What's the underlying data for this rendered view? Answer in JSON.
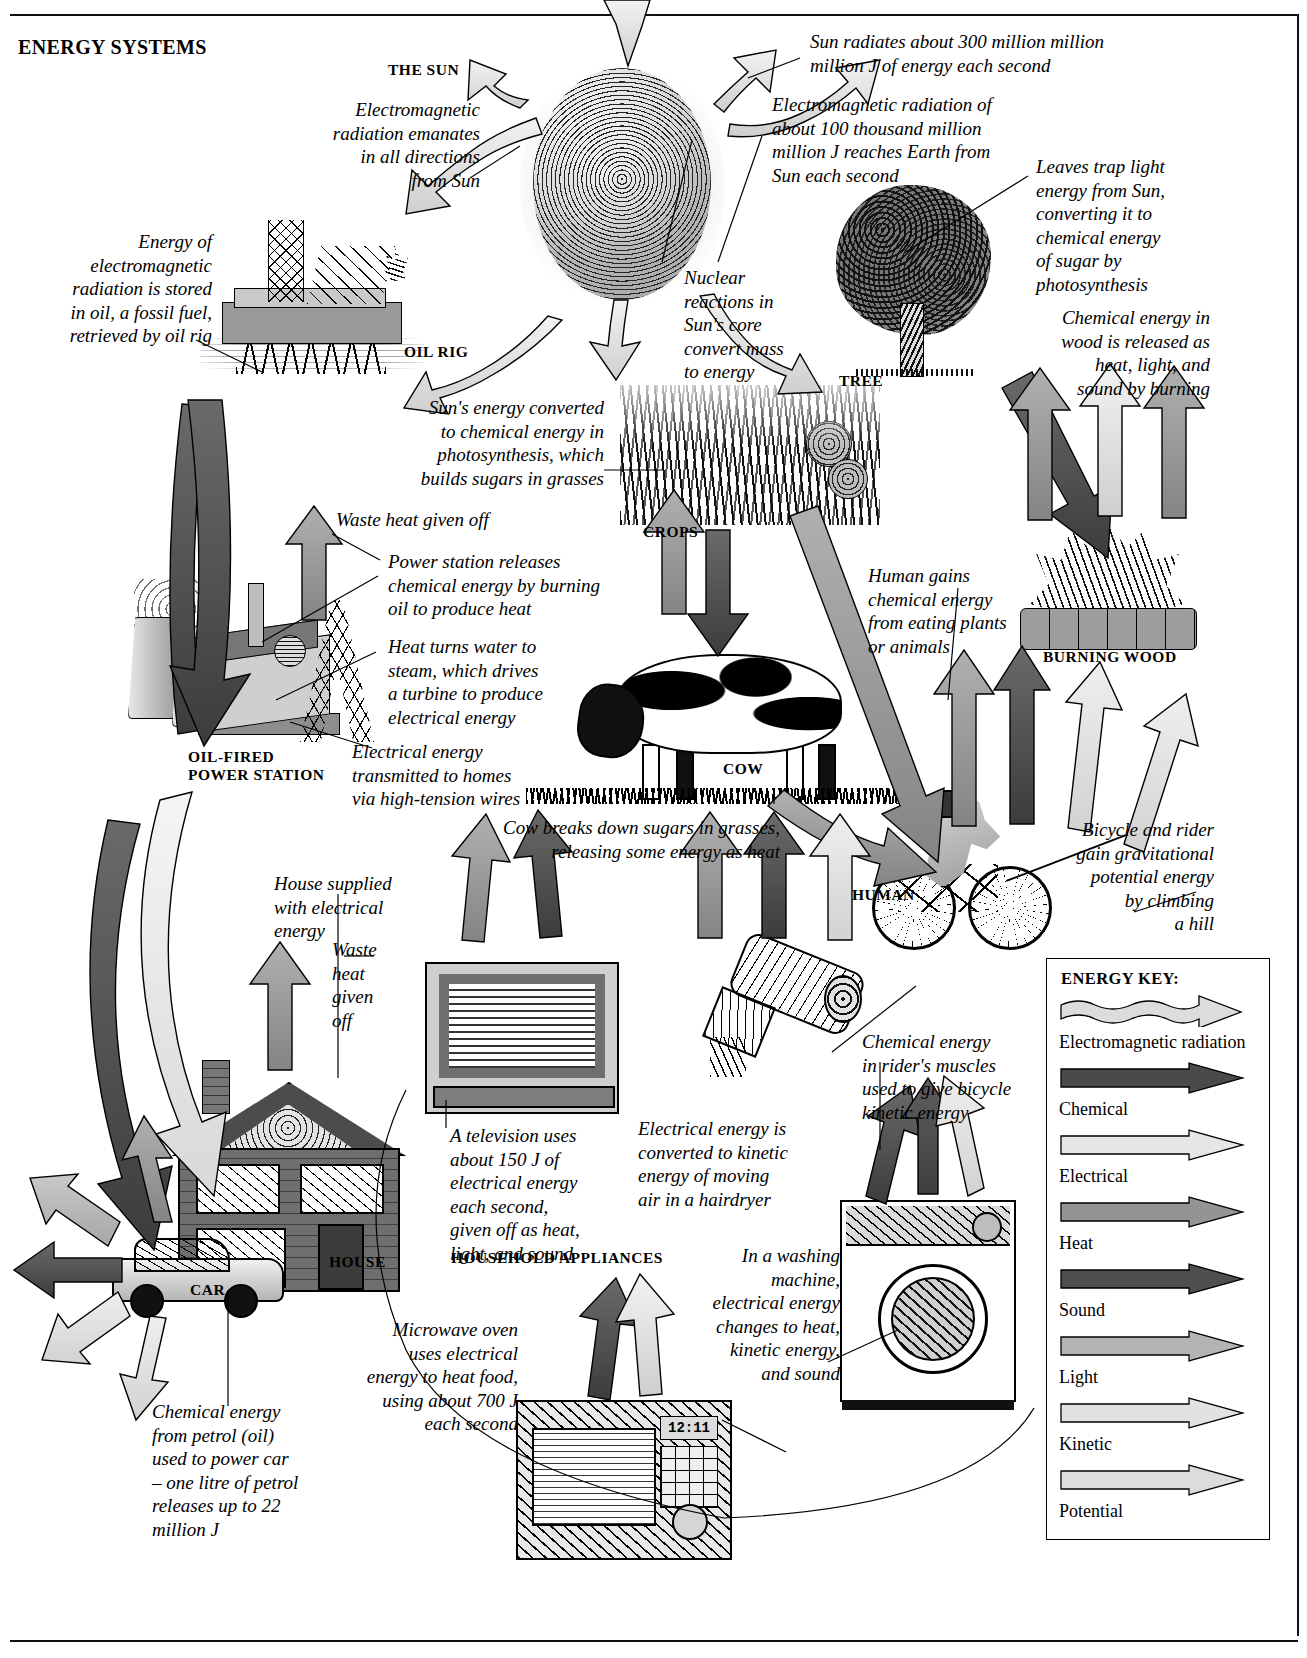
{
  "title": "ENERGY SYSTEMS",
  "labels": {
    "sun": "THE SUN",
    "oil_rig": "OIL RIG",
    "tree": "TREE",
    "crops": "CROPS",
    "burning_wood": "BURNING WOOD",
    "cow": "COW",
    "human": "HUMAN",
    "power_station": "OIL-FIRED\nPOWER STATION",
    "house": "HOUSE",
    "car": "CAR",
    "appliances": "HOUSEHOLD APPLIANCES"
  },
  "captions": {
    "em_emanates": "Electromagnetic\nradiation emanates\nin all directions\nfrom Sun",
    "sun_radiates": "Sun radiates about 300 million million\nmillion J of energy each second",
    "em_reaches_earth": "Electromagnetic radiation of\nabout 100 thousand million\nmillion J reaches Earth from\nSun each second",
    "nuclear_reactions": "Nuclear\nreactions in\nSun's core\nconvert mass\nto energy",
    "leaves_trap": "Leaves trap light\nenergy from Sun,\nconverting it to\nchemical energy\nof sugar by\nphotosynthesis",
    "wood_released": "Chemical energy in\nwood is released as\nheat, light, and\nsound by burning",
    "oil_stored": "Energy of\nelectromagnetic\nradiation is stored\nin oil, a fossil fuel,\nretrieved by oil rig",
    "photosynthesis_grasses": "Sun's energy converted\nto chemical energy in\nphotosynthesis, which\nbuilds sugars in grasses",
    "waste_heat_station": "Waste heat given off",
    "power_station_burns": "Power station releases\nchemical energy by burning\noil to produce heat",
    "heat_turns_water": "Heat turns water to\nsteam, which drives\na turbine to produce\nelectrical energy",
    "electrical_transmitted": "Electrical energy\ntransmitted to homes\nvia high-tension wires",
    "human_gains": "Human gains\nchemical energy\nfrom eating plants\nor animals",
    "cow_breaks_down": "Cow breaks down sugars in grasses,\nreleasing some energy as heat",
    "bicycle_gpe": "Bicycle and rider\ngain gravitational\npotential energy\nby climbing\na hill",
    "house_supplied": "House supplied\nwith electrical\nenergy",
    "waste_heat_house": "Waste\nheat\ngiven\noff",
    "television": "A television uses\nabout 150 J of\nelectrical energy\neach second,\ngiven off as heat,\nlight, and sound",
    "hairdryer": "Electrical energy is\nconverted to kinetic\nenergy of moving\nair in a hairdryer",
    "rider_muscles": "Chemical energy\nin rider's muscles\nused to give bicycle\nkinetic energy",
    "washing_machine": "In a washing\nmachine,\nelectrical energy\nchanges to heat,\nkinetic energy,\nand sound",
    "microwave": "Microwave oven\nuses electrical\nenergy to heat food,\nusing about 700 J\neach second",
    "car_petrol": "Chemical energy\nfrom petrol (oil)\nused to power car\n– one litre of petrol\nreleases up to 22\nmillion J"
  },
  "microwave_display": "12:11",
  "key": {
    "title": "ENERGY KEY:",
    "items": [
      {
        "name": "Electromagnetic radiation",
        "style": "wavy",
        "color": "#dcdcdc"
      },
      {
        "name": "Chemical",
        "style": "solid",
        "color": "#4a4a4a"
      },
      {
        "name": "Electrical",
        "style": "solid",
        "color": "#e6e6e6"
      },
      {
        "name": "Heat",
        "style": "solid",
        "color": "#949494"
      },
      {
        "name": "Sound",
        "style": "solid",
        "color": "#4f4f4f"
      },
      {
        "name": "Light",
        "style": "solid",
        "color": "#b4b4b4"
      },
      {
        "name": "Kinetic",
        "style": "solid",
        "color": "#e2e2e2"
      },
      {
        "name": "Potential",
        "style": "solid",
        "color": "#dcdcdc"
      }
    ]
  },
  "chart_data": {
    "type": "diagram",
    "title": "ENERGY SYSTEMS",
    "nodes": [
      "THE SUN",
      "OIL RIG",
      "TREE",
      "CROPS",
      "BURNING WOOD",
      "OIL-FIRED POWER STATION",
      "COW",
      "HUMAN",
      "HOUSE",
      "CAR",
      "HOUSEHOLD APPLIANCES"
    ],
    "energy_types": [
      "Electromagnetic radiation",
      "Chemical",
      "Electrical",
      "Heat",
      "Sound",
      "Light",
      "Kinetic",
      "Potential"
    ],
    "facts": [
      {
        "label": "Sun output per second",
        "value": 300,
        "unit": "million million million J"
      },
      {
        "label": "Reaching Earth per second",
        "value": 100,
        "unit": "thousand million million J"
      },
      {
        "label": "Television consumption",
        "value": 150,
        "unit": "J per second"
      },
      {
        "label": "Microwave oven consumption",
        "value": 700,
        "unit": "J per second"
      },
      {
        "label": "Energy in one litre of petrol",
        "value": 22,
        "unit": "million J"
      }
    ]
  }
}
